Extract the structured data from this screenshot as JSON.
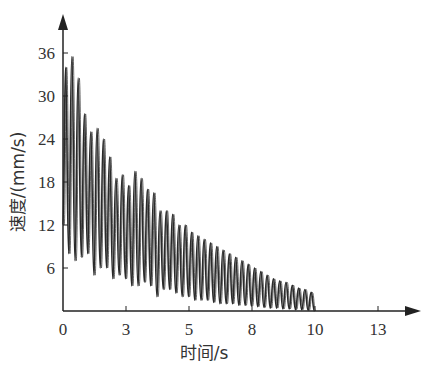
{
  "chart_data": {
    "type": "line",
    "title": "",
    "xlabel": "时间/s",
    "ylabel": "速度/(mm/s)",
    "xticks": [
      "0",
      "3",
      "5",
      "8",
      "10",
      "13"
    ],
    "yticks": [
      "6",
      "12",
      "18",
      "24",
      "30",
      "36"
    ],
    "xlim": [
      0,
      14
    ],
    "ylim": [
      0,
      38
    ],
    "grid": false,
    "legend": null,
    "series": [
      {
        "name": "速度",
        "description": "Damped oscillation of velocity, period ~0.25 s, decaying from ~35 mm/s to ~2 mm/s, ending at t≈10 s",
        "peaks_t": [
          0.1,
          0.35,
          0.6,
          0.85,
          1.1,
          1.35,
          1.6,
          1.85,
          2.1,
          2.35,
          2.6,
          2.85,
          3.1,
          3.35,
          3.6,
          3.85,
          4.1,
          4.35,
          4.6,
          4.85,
          5.1,
          5.35,
          5.6,
          5.85,
          6.1,
          6.35,
          6.6,
          6.85,
          7.1,
          7.35,
          7.6,
          7.85,
          8.1,
          8.35,
          8.6,
          8.85,
          9.1,
          9.35,
          9.6,
          9.85
        ],
        "peaks_v": [
          34,
          35.5,
          32.5,
          27.5,
          25,
          25.5,
          24,
          21.5,
          18.5,
          19,
          17.5,
          19.5,
          18.5,
          17,
          16.5,
          14,
          14,
          13.5,
          12,
          12,
          11,
          10.5,
          10,
          9.5,
          9,
          8.5,
          8,
          7.5,
          7,
          6.5,
          6,
          5.5,
          5,
          4.5,
          4.2,
          4,
          3.6,
          3.2,
          3,
          2.6
        ],
        "troughs_v": [
          8,
          7,
          7.5,
          8,
          5,
          6,
          6,
          4.5,
          5,
          4.5,
          3.5,
          3.5,
          4,
          3.5,
          2,
          3,
          3,
          2.5,
          2,
          2,
          1.5,
          1.5,
          1.5,
          1.2,
          1,
          1,
          1,
          0.8,
          0.8,
          0.7,
          0.6,
          0.5,
          0.4,
          0.4,
          0.3,
          0.3,
          0.2,
          0.2,
          0.1,
          0
        ]
      }
    ]
  },
  "style": {
    "line_color": "#2a2a2a",
    "axis_color": "#222222"
  }
}
